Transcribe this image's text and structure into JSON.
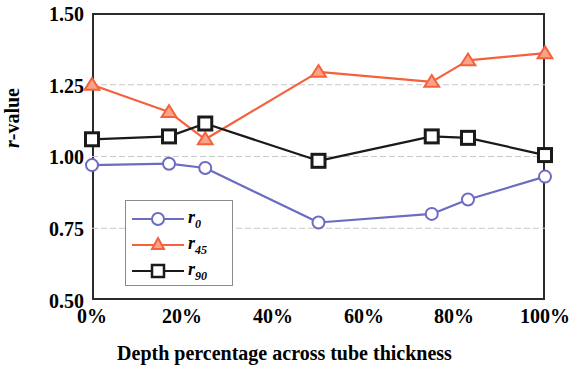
{
  "chart_data": {
    "type": "line",
    "title": "",
    "xlabel": "Depth percentage across tube thickness",
    "ylabel": "r-value",
    "xlim": [
      0,
      100
    ],
    "ylim": [
      0.5,
      1.5
    ],
    "xticks": [
      "0%",
      "20%",
      "40%",
      "60%",
      "80%",
      "100%"
    ],
    "xtick_values": [
      0,
      20,
      40,
      60,
      80,
      100
    ],
    "yticks": [
      "0.50",
      "0.75",
      "1.00",
      "1.25",
      "1.50"
    ],
    "ytick_values": [
      0.5,
      0.75,
      1.0,
      1.25,
      1.5
    ],
    "grid": "horizontal",
    "legend_position": "lower-left-inside",
    "series": [
      {
        "name": "r_0",
        "label": "r",
        "sub": "0",
        "color": "#6C6CC0",
        "marker": "circle",
        "x": [
          0,
          17,
          25,
          50,
          75,
          83,
          100
        ],
        "values": [
          0.97,
          0.975,
          0.96,
          0.77,
          0.8,
          0.85,
          0.93
        ]
      },
      {
        "name": "r_45",
        "label": "r",
        "sub": "45",
        "color": "#F4613C",
        "marker": "triangle",
        "x": [
          0,
          17,
          25,
          50,
          75,
          83,
          100
        ],
        "values": [
          1.25,
          1.155,
          1.06,
          1.295,
          1.26,
          1.335,
          1.36
        ]
      },
      {
        "name": "r_90",
        "label": "r",
        "sub": "90",
        "color": "#1A1A1A",
        "marker": "square",
        "x": [
          0,
          17,
          25,
          50,
          75,
          83,
          100
        ],
        "values": [
          1.06,
          1.07,
          1.115,
          0.985,
          1.07,
          1.065,
          1.005
        ]
      }
    ]
  },
  "axis": {
    "ylabel_prefix": "r",
    "ylabel_suffix": "-value",
    "xlabel_text": "Depth percentage across tube thickness"
  },
  "ticks": {
    "y": [
      "1.50",
      "1.25",
      "1.00",
      "0.75",
      "0.50"
    ],
    "x": [
      "0%",
      "20%",
      "40%",
      "60%",
      "80%",
      "100%"
    ]
  },
  "legend": {
    "entries": [
      {
        "label": "r",
        "sub": "0",
        "color": "#6C6CC0",
        "marker": "circle"
      },
      {
        "label": "r",
        "sub": "45",
        "color": "#F4613C",
        "marker": "triangle"
      },
      {
        "label": "r",
        "sub": "90",
        "color": "#1A1A1A",
        "marker": "square"
      }
    ]
  }
}
